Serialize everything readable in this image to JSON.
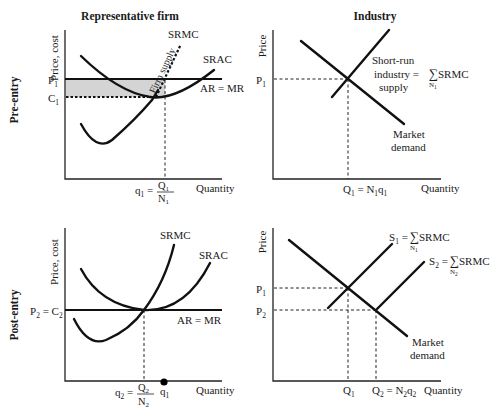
{
  "titles": {
    "left": "Representative firm",
    "right": "Industry",
    "row_top": "Pre-entry",
    "row_bottom": "Post-entry"
  },
  "panels": {
    "pre_firm": {
      "ylabel": "Price, cost",
      "xlabel": "Quantity",
      "p_label": "P",
      "p_sub": "1",
      "c_label": "C",
      "c_sub": "1",
      "srmc": "SRMC",
      "srac": "SRAC",
      "ar_mr": "AR = MR",
      "firm_supply": "Firm supply",
      "q_label": "q",
      "q_sub": "1",
      "q_eq": " = ",
      "q_num": "Q",
      "q_num_sub": "1",
      "q_den": "N",
      "q_den_sub": "1",
      "profit_fill": "#d4d4d4"
    },
    "pre_industry": {
      "ylabel": "Price",
      "xlabel": "Quantity",
      "p_label": "P",
      "p_sub": "1",
      "supply_l1": "Short-run",
      "supply_l2": "industry = ",
      "supply_l3": "supply",
      "sigma": "∑",
      "srmc": "SRMC",
      "sigma_sub": "N",
      "sigma_sub_sub": "1",
      "demand_l1": "Market",
      "demand_l2": "demand",
      "q_label": "Q",
      "q_sub": "1",
      "q_eq": " = N",
      "q_eq_sub": "1",
      "q_tail": "q",
      "q_tail_sub": "1"
    },
    "post_firm": {
      "ylabel": "Price, cost",
      "xlabel": "Quantity",
      "p_label": "P",
      "p_sub": "2",
      "p_eq": " = C",
      "p_eq_sub": "2",
      "srmc": "SRMC",
      "srac": "SRAC",
      "ar_mr": "AR = MR",
      "q_label": "q",
      "q_sub": "2",
      "q_eq": " = ",
      "q_num": "Q",
      "q_num_sub": "2",
      "q_den": "N",
      "q_den_sub": "2",
      "q1_label": "q",
      "q1_sub": "1"
    },
    "post_industry": {
      "ylabel": "Price",
      "xlabel": "Quantity",
      "p1_label": "P",
      "p1_sub": "1",
      "p2_label": "P",
      "p2_sub": "2",
      "s1": "S",
      "s1_sub": "1",
      "s1_eq": " = ",
      "s2": "S",
      "s2_sub": "2",
      "s2_eq": " = ",
      "sigma": "∑",
      "srmc": "SRMC",
      "n1": "N",
      "n1_sub": "1",
      "n2": "N",
      "n2_sub": "2",
      "demand_l1": "Market",
      "demand_l2": "demand",
      "q1_label": "Q",
      "q1_sub": "1",
      "q2_label": "Q",
      "q2_sub": "2",
      "q2_eq": " = N",
      "q2_eq_sub": "2",
      "q2_tail": "q",
      "q2_tail_sub": "2"
    }
  }
}
